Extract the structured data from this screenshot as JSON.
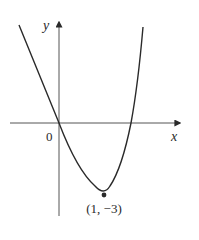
{
  "figure": {
    "x_axis_label": "x",
    "y_axis_label": "y",
    "origin_label": "0",
    "vertex_label": "(1, −3)",
    "curve": "parabola opening upward through origin with vertex at (1, -3)",
    "colors": {
      "ink": "#2a2a2a",
      "background": "#ffffff"
    }
  }
}
